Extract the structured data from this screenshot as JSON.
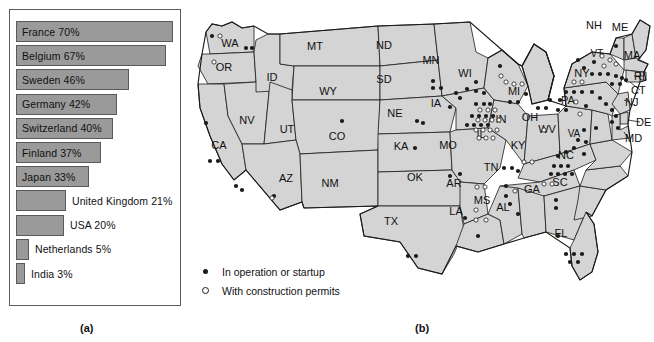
{
  "chart_data": {
    "type": "bar",
    "title": "",
    "xlabel": "",
    "ylabel": "",
    "orientation": "horizontal",
    "xlim": [
      0,
      70
    ],
    "grid": false,
    "categories": [
      "France",
      "Belgium",
      "Sweden",
      "Germany",
      "Switzerland",
      "Finland",
      "Japan",
      "United Kingdom",
      "USA",
      "Netherlands",
      "India"
    ],
    "values": [
      70,
      67,
      46,
      42,
      40,
      37,
      33,
      21,
      20,
      5,
      3
    ],
    "bar_color": "#9a9a9a",
    "bar_border_color": "#5a5a5a",
    "bars": [
      {
        "label": "France 70%",
        "value": 70,
        "label_inside": true,
        "bar_px": 157
      },
      {
        "label": "Belgium 67%",
        "value": 67,
        "label_inside": true,
        "bar_px": 150
      },
      {
        "label": "Sweden 46%",
        "value": 46,
        "label_inside": true,
        "bar_px": 113
      },
      {
        "label": "Germany 42%",
        "value": 42,
        "label_inside": true,
        "bar_px": 101
      },
      {
        "label": "Switzerland 40%",
        "value": 40,
        "label_inside": true,
        "bar_px": 97
      },
      {
        "label": "Finland 37%",
        "value": 37,
        "label_inside": true,
        "bar_px": 85
      },
      {
        "label": "Japan 33%",
        "value": 33,
        "label_inside": true,
        "bar_px": 73
      },
      {
        "label": "United Kingdom 21%",
        "value": 21,
        "label_inside": false,
        "bar_px": 50
      },
      {
        "label": "USA 20%",
        "value": 20,
        "label_inside": false,
        "bar_px": 48
      },
      {
        "label": "Netherlands 5%",
        "value": 5,
        "label_inside": false,
        "bar_px": 13
      },
      {
        "label": "India 3%",
        "value": 3,
        "label_inside": false,
        "bar_px": 9
      }
    ]
  },
  "captions": {
    "panel_a": "(a)",
    "panel_b": "(b)"
  },
  "map": {
    "region": "United States",
    "fill_color": "#d4d4d4",
    "outline_color": "#1a1a1a",
    "legend": [
      {
        "symbol": "filled-dot",
        "label": "In operation or startup"
      },
      {
        "symbol": "open-dot",
        "label": "With construction permits"
      }
    ],
    "state_labels": [
      "WA",
      "OR",
      "ID",
      "MT",
      "ND",
      "SD",
      "MN",
      "WI",
      "MI",
      "NY",
      "VT",
      "NH",
      "ME",
      "MA",
      "RI",
      "CT",
      "NJ",
      "PA",
      "DE",
      "MD",
      "NV",
      "UT",
      "WY",
      "CO",
      "NE",
      "IA",
      "IL",
      "IN",
      "OH",
      "WV",
      "VA",
      "KY",
      "CA",
      "AZ",
      "NM",
      "KA",
      "MO",
      "TN",
      "NC",
      "SC",
      "OK",
      "AR",
      "MS",
      "AL",
      "GA",
      "TX",
      "LA",
      "FL"
    ],
    "marker_counts": {
      "in_operation_or_startup": 104,
      "with_construction_permits": 40
    }
  }
}
